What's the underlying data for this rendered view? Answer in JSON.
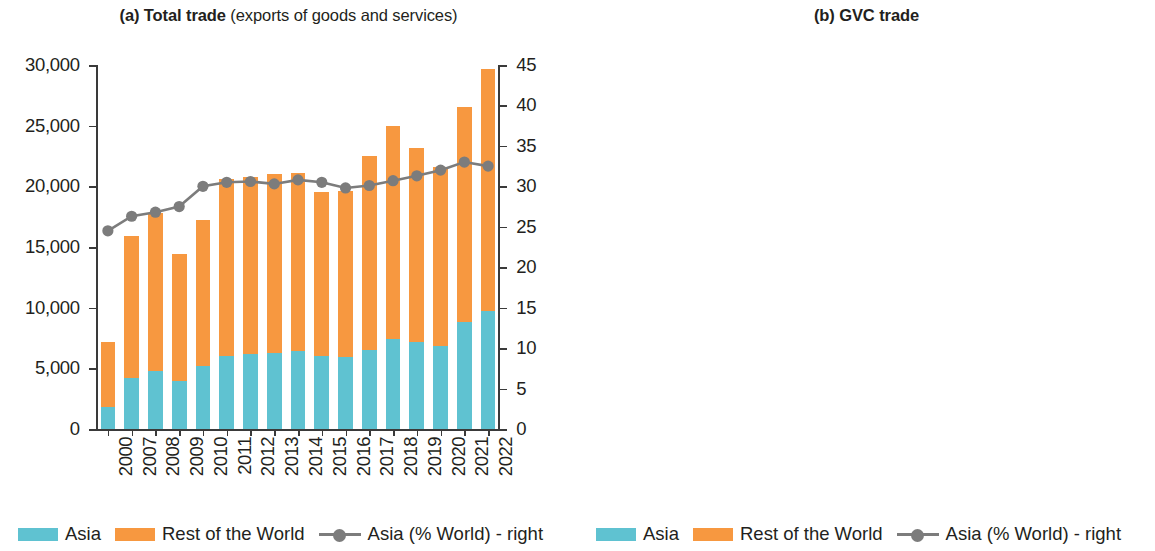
{
  "figure": {
    "panels": [
      {
        "id": "a",
        "title_bold": "(a) Total trade",
        "title_light": " (exports of goods and services)"
      },
      {
        "id": "b",
        "title_bold": "(b) GVC trade",
        "title_light": ""
      }
    ],
    "legend": {
      "asia": "Asia",
      "row": "Rest of the World",
      "line": "Asia (% World) - right"
    },
    "colors": {
      "asia": "#5fc2d1",
      "rest_of_world": "#f79840",
      "line": "#7c7c7c",
      "axis": "#3a3a3a",
      "text": "#231f20"
    }
  },
  "chart_data": [
    {
      "type": "bar",
      "title": "(a) Total trade (exports of goods and services)",
      "xlabel": "",
      "ylabel": "",
      "ylim": [
        0,
        30000
      ],
      "yticks": [
        0,
        5000,
        10000,
        15000,
        20000,
        25000,
        30000
      ],
      "ytick_labels": [
        "0",
        "5,000",
        "10,000",
        "15,000",
        "20,000",
        "25,000",
        "30,000"
      ],
      "y2lim": [
        0,
        45
      ],
      "y2ticks": [
        0,
        5,
        10,
        15,
        20,
        25,
        30,
        35,
        40,
        45
      ],
      "y2tick_labels": [
        "0",
        "5",
        "10",
        "15",
        "20",
        "25",
        "30",
        "35",
        "40",
        "45"
      ],
      "grid": false,
      "legend_position": "bottom-left",
      "categories": [
        "2000",
        "2007",
        "2008",
        "2009",
        "2010",
        "2011",
        "2012",
        "2013",
        "2014",
        "2015",
        "2016",
        "2017",
        "2018",
        "2019",
        "2020",
        "2021",
        "2022"
      ],
      "series": [
        {
          "name": "Asia",
          "axis": "left",
          "kind": "bar-stacked",
          "values": [
            1800,
            4200,
            4800,
            3950,
            5200,
            6050,
            6150,
            6300,
            6450,
            6000,
            5900,
            6550,
            7400,
            7200,
            6850,
            8800,
            9700
          ]
        },
        {
          "name": "Rest of the World",
          "axis": "left",
          "kind": "bar-stacked",
          "values": [
            5400,
            11700,
            13000,
            10450,
            12000,
            14550,
            14650,
            14700,
            14650,
            13500,
            13700,
            15950,
            17600,
            16000,
            14750,
            17700,
            20000
          ]
        },
        {
          "name": "Asia (% World) - right",
          "axis": "right",
          "kind": "line",
          "values": [
            24.5,
            26.3,
            26.8,
            27.5,
            30.0,
            30.5,
            30.6,
            30.3,
            30.8,
            30.5,
            29.8,
            30.1,
            30.7,
            31.3,
            32.0,
            33.0,
            32.5
          ]
        }
      ]
    },
    {
      "type": "bar",
      "title": "(b) GVC trade",
      "xlabel": "",
      "ylabel": "",
      "ylim": [
        0,
        30000
      ],
      "yticks": [
        0,
        5000,
        10000,
        15000,
        20000,
        25000,
        30000
      ],
      "ytick_labels": [
        "0",
        "5,000",
        "10,000",
        "15,000",
        "20,000",
        "25,000",
        "30,000"
      ],
      "y2lim": [
        0,
        35
      ],
      "y2ticks": [
        0,
        5,
        10,
        15,
        20,
        25,
        30,
        35
      ],
      "y2tick_labels": [
        "0",
        "5",
        "10",
        "15",
        "20",
        "25",
        "30",
        "35"
      ],
      "grid": false,
      "legend_position": "bottom-left",
      "categories": [
        "2000",
        "2007",
        "2008",
        "2009",
        "2010",
        "2011",
        "2012",
        "2013",
        "2014",
        "2015",
        "2016",
        "2017",
        "2018",
        "2019",
        "2020",
        "2021",
        "2022"
      ],
      "series": [
        {
          "name": "Asia",
          "axis": "left",
          "kind": "bar-stacked",
          "values": [
            450,
            1550,
            1800,
            1300,
            1800,
            2100,
            2200,
            2250,
            2200,
            1950,
            1950,
            2200,
            2550,
            2400,
            2350,
            3000,
            3500
          ]
        },
        {
          "name": "Rest of the World",
          "axis": "left",
          "kind": "bar-stacked",
          "values": [
            2050,
            4150,
            4800,
            3650,
            4400,
            5500,
            5400,
            5550,
            5600,
            5050,
            5100,
            6150,
            6800,
            5950,
            5250,
            7000,
            8200
          ]
        },
        {
          "name": "Asia (% World) - right",
          "axis": "right",
          "kind": "line",
          "values": [
            23.5,
            25.1,
            25.5,
            26.1,
            28.0,
            27.9,
            28.1,
            27.9,
            28.3,
            27.6,
            27.4,
            25.9,
            27.2,
            28.2,
            29.0,
            29.8,
            29.4
          ]
        }
      ]
    }
  ]
}
